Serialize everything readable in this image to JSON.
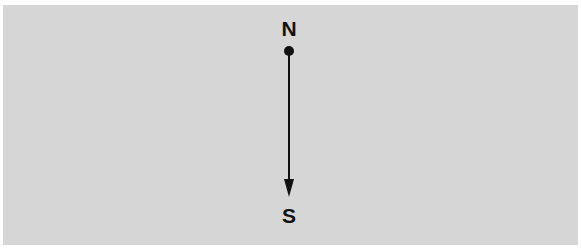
{
  "diagram": {
    "type": "compass-direction",
    "start_label": "N",
    "end_label": "S",
    "arrow_direction": "north-to-south",
    "colors": {
      "background": "#d6d6d6",
      "ink": "#111111",
      "margin": "#ffffff"
    }
  }
}
